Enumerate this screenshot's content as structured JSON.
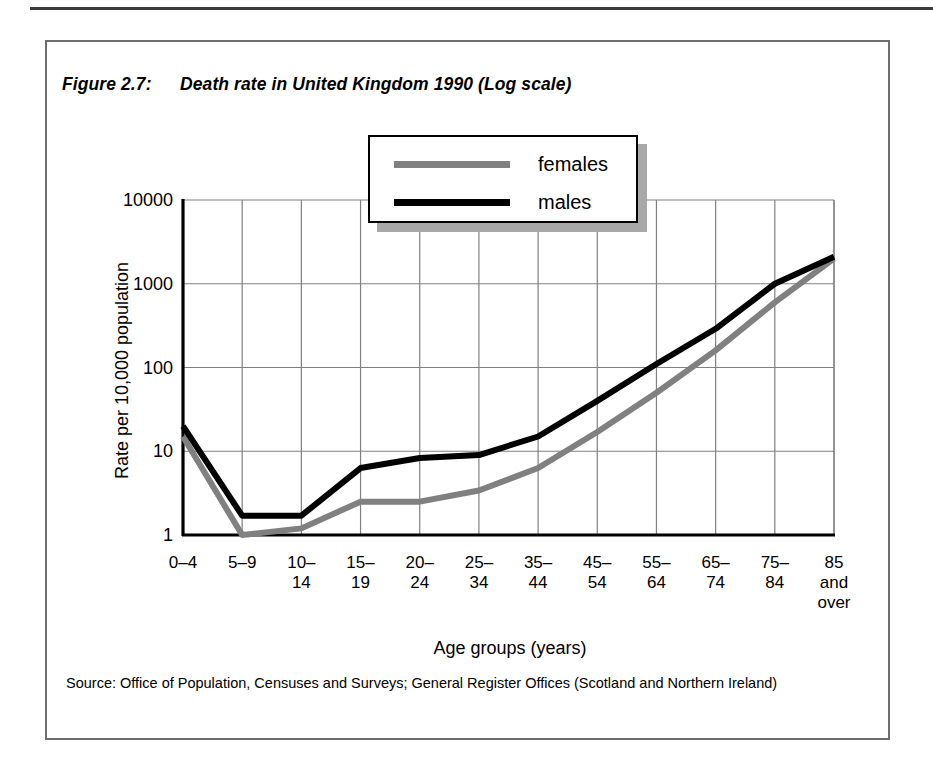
{
  "figure": {
    "number": "Figure 2.7:",
    "title": "Death rate in United Kingdom 1990 (Log scale)",
    "source": "Source: Office of Population, Censuses and Surveys; General Register Offices (Scotland and Northern Ireland)"
  },
  "colors": {
    "males_line": "#000000",
    "females_line": "#808080",
    "grid": "#808080",
    "axis": "#000000",
    "figure_border": "#6e6e6e",
    "legend_shadow": "#a8a8a8"
  },
  "chart_data": {
    "type": "line",
    "title": "Death rate in United Kingdom 1990 (Log scale)",
    "xlabel": "Age groups (years)",
    "ylabel": "Rate per 10,000 population",
    "categories": [
      "0–4",
      "5–9",
      "10–\n14",
      "15–\n19",
      "20–\n24",
      "25–\n34",
      "35–\n44",
      "45–\n54",
      "55–\n64",
      "65–\n74",
      "75–\n84",
      "85\nand\nover"
    ],
    "yscale": "log",
    "ylim": [
      1,
      10000
    ],
    "yticks": [
      1,
      10,
      100,
      1000,
      10000
    ],
    "ytick_labels": [
      "1",
      "10",
      "100",
      "1000",
      "10000"
    ],
    "grid": true,
    "legend_position": "top-center",
    "series": [
      {
        "name": "females",
        "color": "#808080",
        "values": [
          15,
          1.0,
          1.2,
          2.5,
          2.5,
          3.4,
          6.3,
          17,
          50,
          160,
          600,
          2000
        ]
      },
      {
        "name": "males",
        "color": "#000000",
        "values": [
          20,
          1.7,
          1.7,
          6.3,
          8.3,
          9.0,
          15,
          40,
          110,
          290,
          1000,
          2100
        ]
      }
    ]
  },
  "legend": {
    "items": [
      {
        "label": "females",
        "color": "#808080"
      },
      {
        "label": "males",
        "color": "#000000"
      }
    ]
  }
}
